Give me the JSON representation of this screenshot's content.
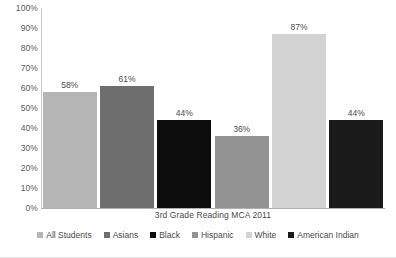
{
  "chart_data": {
    "type": "bar",
    "title": "3rd Grade Reading MCA 2011",
    "xlabel": "3rd Grade Reading MCA 2011",
    "ylabel": "",
    "ylim": [
      0,
      100
    ],
    "grid": false,
    "legend_position": "bottom",
    "categories": [
      "All Students",
      "Asians",
      "Black",
      "Hispanic",
      "White",
      "American Indian"
    ],
    "values": [
      58,
      61,
      44,
      36,
      87,
      44
    ],
    "data_labels": [
      "58%",
      "61%",
      "44%",
      "36%",
      "87%",
      "44%"
    ],
    "colors": [
      "#b5b5b5",
      "#6e6e6e",
      "#0d0d0d",
      "#939393",
      "#d3d3d3",
      "#1a1a1a"
    ],
    "y_ticks": [
      {
        "value": 100,
        "label": "100%"
      },
      {
        "value": 90,
        "label": "90%"
      },
      {
        "value": 80,
        "label": "80%"
      },
      {
        "value": 70,
        "label": "70%"
      },
      {
        "value": 60,
        "label": "60%"
      },
      {
        "value": 50,
        "label": "50%"
      },
      {
        "value": 40,
        "label": "40%"
      },
      {
        "value": 30,
        "label": "30%"
      },
      {
        "value": 20,
        "label": "20%"
      },
      {
        "value": 10,
        "label": "10%"
      },
      {
        "value": 0,
        "label": "0%"
      }
    ],
    "series": [
      {
        "name": "3rd Grade Reading MCA 2011",
        "values": [
          58,
          61,
          44,
          36,
          87,
          44
        ]
      }
    ],
    "legend": [
      {
        "label": "All Students",
        "color": "#b5b5b5"
      },
      {
        "label": "Asians",
        "color": "#6e6e6e"
      },
      {
        "label": "Black",
        "color": "#0d0d0d"
      },
      {
        "label": "Hispanic",
        "color": "#939393"
      },
      {
        "label": "White",
        "color": "#d3d3d3"
      },
      {
        "label": "American Indian",
        "color": "#1a1a1a"
      }
    ]
  }
}
